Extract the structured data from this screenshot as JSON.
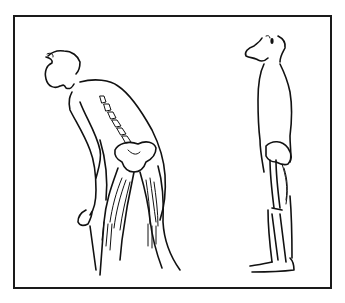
{
  "illustration": {
    "description": "Line drawing comparing two postures: a bent-forward figure showing spine, pelvis and thigh muscles, and an upright standing figure showing pelvis and leg bones",
    "figures": [
      {
        "name": "bent-posture-figure",
        "features": [
          "head tilted up",
          "curved spine vertebrae",
          "pelvis",
          "hamstring muscles",
          "hand hanging at knee"
        ]
      },
      {
        "name": "upright-posture-figure",
        "features": [
          "head",
          "straight torso",
          "pelvis",
          "femur",
          "calf muscles",
          "foot"
        ]
      }
    ],
    "border_color": "#1a1a1a",
    "ink_color": "#111111",
    "background_color": "#ffffff"
  }
}
